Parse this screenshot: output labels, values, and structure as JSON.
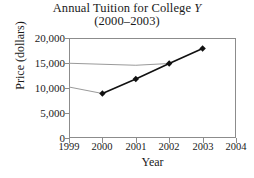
{
  "chart_data": {
    "type": "line",
    "title": "Annual Tuition for College Y",
    "title_prefix": "Annual Tuition for College ",
    "title_italic": "Y",
    "subtitle": "(2000–2003)",
    "xlabel": "Year",
    "ylabel": "Price  (dollars)",
    "x": [
      2000,
      2001,
      2002,
      2003
    ],
    "values": [
      8900,
      11800,
      14900,
      17900
    ],
    "series": [
      {
        "name": "Annual Tuition",
        "x": [
          2000,
          2001,
          2002,
          2003
        ],
        "values": [
          8900,
          11800,
          14900,
          17900
        ],
        "marker": "diamond",
        "color": "#111111"
      }
    ],
    "xlim": [
      1999,
      2004
    ],
    "ylim": [
      0,
      20000
    ],
    "xticks": [
      1999,
      2000,
      2001,
      2002,
      2003,
      2004
    ],
    "xtick_labels": [
      "1999",
      "2000",
      "2001",
      "2002",
      "2003",
      "2004"
    ],
    "yticks": [
      0,
      5000,
      10000,
      15000,
      20000
    ],
    "ytick_labels": [
      "0",
      "5,000",
      "10,000",
      "15,000",
      "20,000"
    ],
    "grid": false,
    "legend": false,
    "legend_position": "none",
    "artifact_lines": [
      {
        "name": "faint-gray-upper",
        "color": "#9a9a9a",
        "points": [
          [
            1999,
            14950
          ],
          [
            2001,
            14550
          ],
          [
            2002,
            14900
          ]
        ]
      },
      {
        "name": "faint-gray-lower",
        "color": "#9a9a9a",
        "points": [
          [
            1999,
            10200
          ],
          [
            2000,
            8900
          ]
        ]
      }
    ],
    "colors": {
      "line": "#111111",
      "marker": "#111111",
      "axis": "#8c8c8c",
      "text": "#1a1a1a",
      "artifact": "#9a9a9a",
      "background": "#ffffff"
    }
  }
}
